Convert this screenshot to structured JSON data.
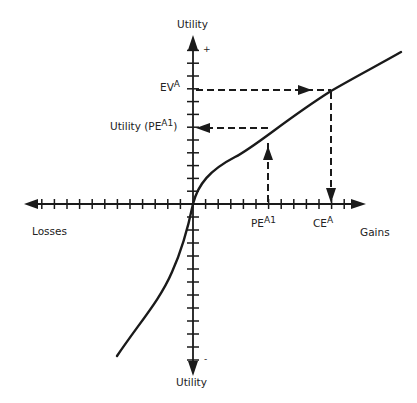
{
  "figure": {
    "type": "utility-function-diagram",
    "colors": {
      "ink": "#1a1a1a",
      "background": "#ffffff"
    },
    "axes": {
      "y_axis_top_label": "Utility",
      "y_axis_bottom_label": "Utility",
      "y_positive_marker": "+",
      "y_negative_marker": "-",
      "x_axis_left_label": "Losses",
      "x_axis_right_label": "Gains",
      "x_ticks_left_count": 12,
      "x_ticks_right_count": 12,
      "y_ticks_up_count": 12,
      "y_ticks_down_count": 12
    },
    "labels": {
      "ev_base": "EV",
      "ev_sup": "A",
      "utility_pe_base": "Utility (PE",
      "utility_pe_sup": "A1",
      "utility_pe_close": ")",
      "pe_base": "PE",
      "pe_sup": "A1",
      "ce_base": "CE",
      "ce_sup": "A"
    },
    "curve": {
      "description": "Concave for gains, steeper/convex for losses (S-shaped utility function passing through origin)"
    },
    "guides": [
      {
        "name": "ev-to-curve",
        "direction": "right",
        "from": "EV^A on utility axis",
        "to": "curve"
      },
      {
        "name": "curve-to-ce",
        "direction": "down",
        "from": "curve",
        "to": "CE^A on gains axis"
      },
      {
        "name": "pe-to-curve",
        "direction": "up",
        "from": "PE^A1 on gains axis",
        "to": "curve"
      },
      {
        "name": "curve-to-utility-pe",
        "direction": "left",
        "from": "curve",
        "to": "Utility (PE^A1) on utility axis"
      }
    ]
  }
}
